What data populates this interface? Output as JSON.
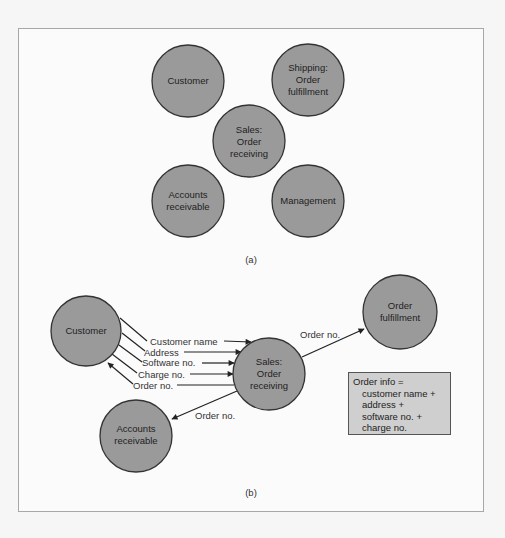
{
  "colors": {
    "node_fill": "#9a9a9a",
    "node_stroke": "#333333",
    "info_box_fill": "#cfcfcf",
    "frame_border": "#a8a8a8"
  },
  "panel_a": {
    "label": "(a)",
    "nodes": [
      {
        "id": "customer",
        "lines": [
          "Customer"
        ]
      },
      {
        "id": "shipping",
        "lines": [
          "Shipping:",
          "Order",
          "fulfillment"
        ]
      },
      {
        "id": "sales",
        "lines": [
          "Sales:",
          "Order",
          "receiving"
        ]
      },
      {
        "id": "accounts",
        "lines": [
          "Accounts",
          "receivable"
        ]
      },
      {
        "id": "management",
        "lines": [
          "Management"
        ]
      }
    ]
  },
  "panel_b": {
    "label": "(b)",
    "nodes": [
      {
        "id": "customer",
        "lines": [
          "Customer"
        ]
      },
      {
        "id": "sales",
        "lines": [
          "Sales:",
          "Order",
          "receiving"
        ]
      },
      {
        "id": "order_fulfillment",
        "lines": [
          "Order",
          "fulfillment"
        ]
      },
      {
        "id": "accounts",
        "lines": [
          "Accounts",
          "receivable"
        ]
      }
    ],
    "flows": [
      {
        "label": "Customer name",
        "from": "customer",
        "to": "sales"
      },
      {
        "label": "Address",
        "from": "customer",
        "to": "sales"
      },
      {
        "label": "Software no.",
        "from": "customer",
        "to": "sales"
      },
      {
        "label": "Charge no.",
        "from": "customer",
        "to": "sales"
      },
      {
        "label": "Order no.",
        "from": "sales",
        "to": "customer"
      },
      {
        "label": "Order no.",
        "from": "sales",
        "to": "order_fulfillment"
      },
      {
        "label": "Order no.",
        "from": "sales",
        "to": "accounts"
      }
    ],
    "info_box": {
      "title": "Order info =",
      "lines": [
        "customer name +",
        "address +",
        "software no. +",
        "charge no."
      ]
    }
  }
}
